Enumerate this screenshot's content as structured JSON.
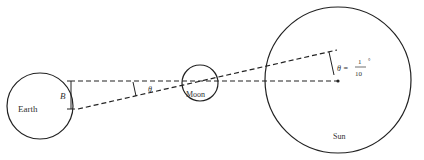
{
  "diagram": {
    "title": "",
    "bodies": [
      {
        "name": "Earth",
        "label": "Earth"
      },
      {
        "name": "Moon",
        "label": "Moon"
      },
      {
        "name": "Sun",
        "label": "Sun"
      }
    ],
    "labels": {
      "earth": "Earth",
      "moon": "Moon",
      "sun": "Sun",
      "baseline": "B",
      "angle_small": "θ",
      "angle_sun_lhs": "θ =",
      "angle_sun_num": "1",
      "angle_sun_den": "10",
      "angle_sun_unit": "°"
    },
    "colors": {
      "stroke": "#222222",
      "text": "#333333",
      "background": "#ffffff"
    }
  }
}
